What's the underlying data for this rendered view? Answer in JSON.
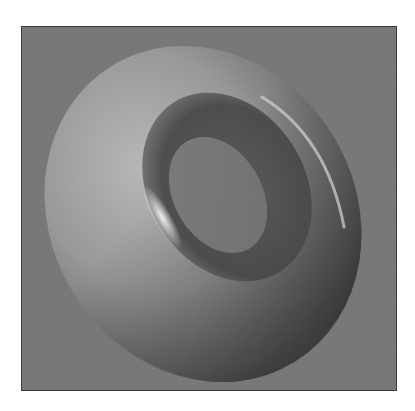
{
  "image": {
    "subject": "3D rendered torus",
    "style": "grayscale shaded rendering",
    "colors": {
      "background": "#7b7b7b",
      "frame_border": "#3a3a3a",
      "torus_light": "#bdbdbd",
      "torus_mid": "#8e8e8e",
      "torus_dark": "#4a4a4a",
      "highlight": "#f4f4f4",
      "page": "#ffffff"
    }
  }
}
